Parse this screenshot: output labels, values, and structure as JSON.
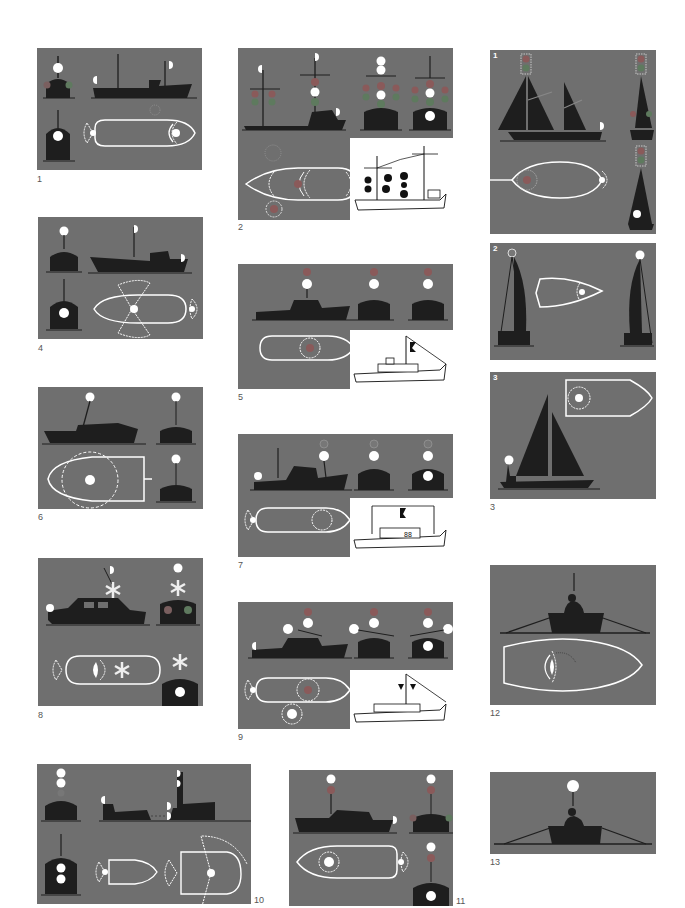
{
  "page": {
    "background": "#ffffff",
    "panel_color": "#6f6f6f",
    "silhouette_color": "#1e1e1e",
    "light_white": "#ffffff",
    "light_red_dim": "#8a5a5a",
    "light_green_dim": "#5e7a5e"
  },
  "figures": [
    {
      "id": "fig-1",
      "label": "1",
      "description": "Power-driven vessel underway: masthead lights, sidelights, sternlight"
    },
    {
      "id": "fig-2",
      "label": "2",
      "description": "Vessel with all-round lights on masts, with line-drawing inset"
    },
    {
      "id": "fig-3",
      "label": "3",
      "description": "Sailing vessels",
      "subpanels": [
        "1",
        "2",
        "3"
      ]
    },
    {
      "id": "fig-4",
      "label": "4",
      "description": "Vessel with masthead and sidelights, plan view of arcs"
    },
    {
      "id": "fig-5",
      "label": "5",
      "description": "Vessel with red over white all-round lights, line-drawing inset"
    },
    {
      "id": "fig-6",
      "label": "6",
      "description": "Small vessel with all-round white light"
    },
    {
      "id": "fig-7",
      "label": "7",
      "description": "Vessel with all-round lights and sternlight, line-drawing inset"
    },
    {
      "id": "fig-8",
      "label": "8",
      "description": "Vessel with flashing (asterisk) light"
    },
    {
      "id": "fig-9",
      "label": "9",
      "description": "Vessel with red/white lights and yardarm lights, line-drawing inset"
    },
    {
      "id": "fig-10",
      "label": "10",
      "description": "Towing vessel with tow, plan view arcs"
    },
    {
      "id": "fig-11",
      "label": "11",
      "description": "Vessel with white over red all-round lights"
    },
    {
      "id": "fig-12",
      "label": "12",
      "description": "Rowing boat with torch, plan view"
    },
    {
      "id": "fig-13",
      "label": "13",
      "description": "Rowing boat with all-round white light"
    }
  ]
}
